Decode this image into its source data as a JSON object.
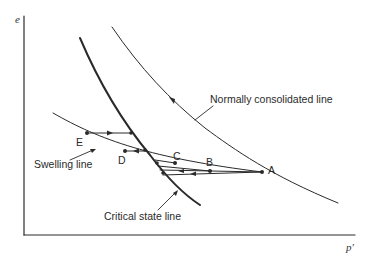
{
  "diagram": {
    "axes": {
      "y_label": "e",
      "x_label": "p′"
    },
    "curves": {
      "ncl": {
        "label": "Normally consolidated line"
      },
      "csl": {
        "label": "Critical state line"
      },
      "swelling": {
        "label": "Swelling line"
      }
    },
    "points": [
      {
        "id": "A",
        "label": "A"
      },
      {
        "id": "B",
        "label": "B"
      },
      {
        "id": "C",
        "label": "C"
      },
      {
        "id": "D",
        "label": "D"
      },
      {
        "id": "E",
        "label": "E"
      }
    ],
    "colors": {
      "ink": "#2a2a2a",
      "background": "#ffffff"
    }
  }
}
